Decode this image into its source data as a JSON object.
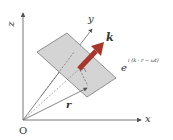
{
  "diagram": {
    "axes": {
      "origin_label": "O",
      "x_label": "x",
      "y_label": "y",
      "z_label": "z"
    },
    "vectors": {
      "wave_vector_label": "k",
      "position_vector_label": "r"
    },
    "expression": {
      "base": "e",
      "exponent": "i (k · r − ωt)"
    },
    "colors": {
      "arrow": "#a8362c",
      "plane": "#d4d4d4",
      "plane_edge": "#6a6a6a",
      "axis": "#555555"
    }
  }
}
